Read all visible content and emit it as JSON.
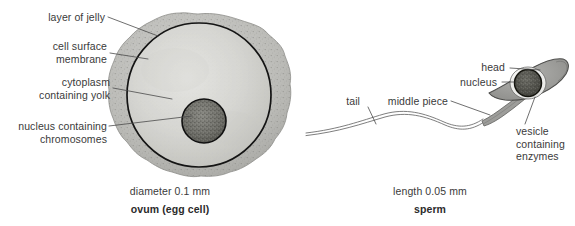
{
  "figure": {
    "background_color": "#ffffff",
    "ink_color": "#3a3a3a"
  },
  "ovum": {
    "caption_size": "diameter 0.1 mm",
    "caption_name": "ovum (egg cell)",
    "labels": [
      {
        "id": "layer-of-jelly",
        "text": "layer of jelly"
      },
      {
        "id": "cell-surface-membrane",
        "text": "cell surface\nmembrane"
      },
      {
        "id": "cytoplasm-containing-yolk",
        "text": "cytoplasm\ncontaining yolk"
      },
      {
        "id": "nucleus-containing-chromosomes",
        "text": "nucleus containing\nchromosomes"
      }
    ],
    "colors": {
      "jelly": "#b9b9b9",
      "cytoplasm": "#d3d3d0",
      "nucleus": "#6e6e6a",
      "membrane": "#1a1a1a"
    }
  },
  "sperm": {
    "caption_size": "length 0.05 mm",
    "caption_name": "sperm",
    "labels": [
      {
        "id": "tail",
        "text": "tail"
      },
      {
        "id": "middle-piece",
        "text": "middle piece"
      },
      {
        "id": "head",
        "text": "head"
      },
      {
        "id": "nucleus",
        "text": "nucleus"
      },
      {
        "id": "vesicle-containing-enzymes",
        "text": "vesicle\ncontaining\nenzymes"
      }
    ],
    "colors": {
      "head": "#9a9a9a",
      "nucleus": "#55554f",
      "tail": "#6f6f6f",
      "vesicle": "#ffffff"
    }
  }
}
